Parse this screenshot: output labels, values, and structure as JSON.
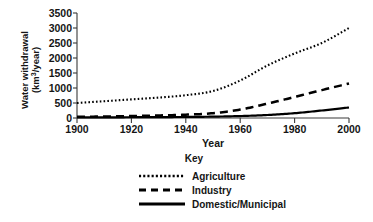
{
  "chart_data": {
    "type": "line",
    "title": "",
    "xlabel": "Year",
    "ylabel": "Water withdrawal (km3/year)",
    "ylabel_line1": "Water withdrawal",
    "ylabel_line2_prefix": "(km",
    "ylabel_line2_sup": "3",
    "ylabel_line2_suffix": "/year)",
    "xlim": [
      1900,
      2000
    ],
    "ylim": [
      0,
      3500
    ],
    "grid": false,
    "legend_position": "below",
    "xticks": [
      1900,
      1920,
      1940,
      1960,
      1980,
      2000
    ],
    "xtick_labels": [
      "1900",
      "1920",
      "1940",
      "1960",
      "1980",
      "2000"
    ],
    "yticks": [
      0,
      500,
      1000,
      1500,
      2000,
      2500,
      3000,
      3500
    ],
    "ytick_labels": [
      "0",
      "500",
      "1000",
      "1500",
      "2000",
      "2500",
      "3000",
      "3500"
    ],
    "x": [
      1900,
      1910,
      1920,
      1930,
      1940,
      1950,
      1960,
      1970,
      1980,
      1990,
      2000
    ],
    "series": [
      {
        "name": "Agriculture",
        "style": "dotted",
        "color": "#000000",
        "values": [
          500,
          560,
          620,
          680,
          760,
          900,
          1250,
          1750,
          2150,
          2500,
          3000
        ]
      },
      {
        "name": "Industry",
        "style": "dashed",
        "color": "#000000",
        "values": [
          40,
          50,
          65,
          85,
          110,
          160,
          280,
          480,
          700,
          930,
          1150
        ]
      },
      {
        "name": "Domestic/Municipal",
        "style": "solid",
        "color": "#000000",
        "values": [
          20,
          22,
          25,
          30,
          35,
          45,
          65,
          100,
          160,
          250,
          350
        ]
      }
    ]
  },
  "legend": {
    "title": "Key",
    "items": [
      {
        "label": "Agriculture",
        "style": "dotted"
      },
      {
        "label": "Industry",
        "style": "dashed"
      },
      {
        "label": "Domestic/Municipal",
        "style": "solid"
      }
    ]
  },
  "axes": {
    "x_title": "Year",
    "y_title_line1": "Water withdrawal",
    "y_title_unit_prefix": "(km",
    "y_title_unit_sup": "3",
    "y_title_unit_suffix": "/year)"
  }
}
